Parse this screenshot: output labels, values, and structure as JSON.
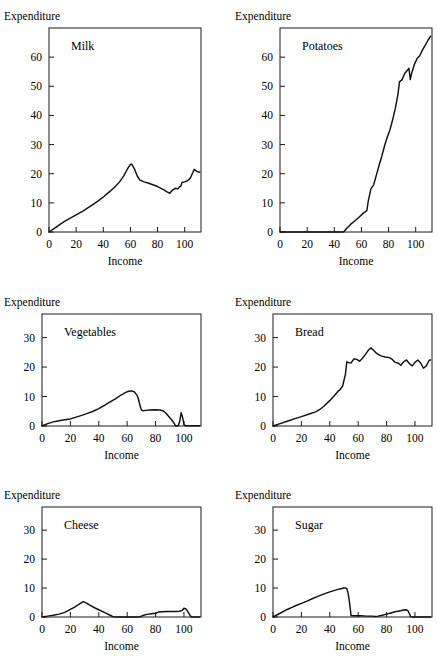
{
  "figure": {
    "ylabel": "Expenditure",
    "xlabel": "Income",
    "line_color": "#111111",
    "axis_color": "#1a1a1a",
    "background": "#ffffff"
  },
  "chart_data": [
    {
      "type": "line",
      "title": "Milk",
      "xlabel": "Income",
      "ylabel": "Expenditure",
      "xlim": [
        0,
        112
      ],
      "ylim": [
        0,
        70
      ],
      "xticks": [
        0,
        20,
        40,
        60,
        80,
        100
      ],
      "yticks": [
        0,
        10,
        20,
        30,
        40,
        50,
        60
      ],
      "grid": false,
      "legend": "none",
      "x": [
        0,
        5,
        10,
        15,
        20,
        25,
        28,
        32,
        36,
        40,
        44,
        48,
        52,
        55,
        58,
        60,
        61,
        63,
        65,
        67,
        70,
        73,
        76,
        80,
        84,
        87,
        89,
        91,
        93,
        95,
        96,
        97,
        98,
        100,
        102,
        104,
        106,
        107,
        109,
        111
      ],
      "y": [
        0,
        1.6,
        3.2,
        4.6,
        5.9,
        7.2,
        8.1,
        9.3,
        10.6,
        12.0,
        13.6,
        15.2,
        17.2,
        19.2,
        21.8,
        23.2,
        23.3,
        21.6,
        19.3,
        17.8,
        17.2,
        16.8,
        16.3,
        15.6,
        14.6,
        13.8,
        13.3,
        14.4,
        15.0,
        14.8,
        15.5,
        15.6,
        17.0,
        17.2,
        17.6,
        18.4,
        20.4,
        21.5,
        20.8,
        20.5
      ]
    },
    {
      "type": "line",
      "title": "Potatoes",
      "xlabel": "Income",
      "ylabel": "Expenditure",
      "xlim": [
        0,
        112
      ],
      "ylim": [
        0,
        70
      ],
      "xticks": [
        0,
        20,
        40,
        60,
        80,
        100
      ],
      "yticks": [
        0,
        10,
        20,
        30,
        40,
        50,
        60
      ],
      "grid": false,
      "legend": "none",
      "x": [
        0,
        10,
        20,
        30,
        40,
        46,
        47,
        49,
        52,
        55,
        58,
        61,
        63,
        64,
        65,
        67,
        69,
        71,
        73,
        75,
        77,
        79,
        81,
        83,
        85,
        87,
        88,
        90,
        92,
        94,
        95,
        96,
        97,
        99,
        101,
        103,
        105,
        107,
        109,
        111
      ],
      "y": [
        0,
        0,
        0,
        0,
        0,
        0,
        0.1,
        1.2,
        2.6,
        3.8,
        5.0,
        6.3,
        7.0,
        7.3,
        10.5,
        14.8,
        16.2,
        19.5,
        22.8,
        26.0,
        29.5,
        32.5,
        35.0,
        38.5,
        42.5,
        47.5,
        51.5,
        52.3,
        54.5,
        55.6,
        56.2,
        52.3,
        54.5,
        57.5,
        59.5,
        60.5,
        62.5,
        64.0,
        65.8,
        67.2
      ]
    },
    {
      "type": "line",
      "title": "Vegetables",
      "xlabel": "Income",
      "ylabel": "Expenditure",
      "xlim": [
        0,
        112
      ],
      "ylim": [
        0,
        38
      ],
      "xticks": [
        0,
        20,
        40,
        60,
        80,
        100
      ],
      "yticks": [
        0,
        10,
        20,
        30
      ],
      "grid": false,
      "legend": "none",
      "x": [
        0,
        4,
        8,
        12,
        16,
        20,
        24,
        28,
        32,
        36,
        40,
        44,
        48,
        52,
        56,
        59,
        61,
        63,
        65,
        67,
        68,
        69,
        70,
        71,
        73,
        76,
        80,
        83,
        85,
        87,
        89,
        91,
        93,
        94,
        96,
        97,
        98,
        99,
        100,
        101,
        103,
        106,
        109,
        111
      ],
      "y": [
        0,
        0.8,
        1.4,
        1.8,
        2.1,
        2.4,
        3.0,
        3.6,
        4.3,
        5.0,
        5.9,
        7.0,
        8.2,
        9.3,
        10.6,
        11.4,
        11.8,
        11.9,
        11.6,
        10.4,
        9.0,
        7.0,
        5.4,
        5.2,
        5.3,
        5.4,
        5.5,
        5.4,
        5.2,
        4.5,
        3.4,
        2.3,
        1.0,
        0.1,
        0.1,
        1.6,
        4.5,
        3.0,
        0.6,
        0.1,
        0.1,
        0.1,
        0.1,
        0.1
      ]
    },
    {
      "type": "line",
      "title": "Bread",
      "xlabel": "Income",
      "ylabel": "Expenditure",
      "xlim": [
        0,
        112
      ],
      "ylim": [
        0,
        38
      ],
      "xticks": [
        0,
        20,
        40,
        60,
        80,
        100
      ],
      "yticks": [
        0,
        10,
        20,
        30
      ],
      "grid": false,
      "legend": "none",
      "x": [
        0,
        5,
        10,
        15,
        20,
        25,
        30,
        33,
        36,
        40,
        43,
        46,
        47,
        49,
        51,
        52,
        53,
        55,
        57,
        59,
        61,
        63,
        65,
        67,
        69,
        71,
        73,
        76,
        79,
        82,
        84,
        86,
        88,
        90,
        92,
        94,
        96,
        98,
        100,
        102,
        104,
        106,
        108,
        110,
        111
      ],
      "y": [
        0,
        0.8,
        1.6,
        2.4,
        3.2,
        4.0,
        4.8,
        5.6,
        6.8,
        8.6,
        10.2,
        11.9,
        12.2,
        13.5,
        17.5,
        21.8,
        21.5,
        21.4,
        22.8,
        22.6,
        22.0,
        23.0,
        24.2,
        25.6,
        26.5,
        25.6,
        24.6,
        23.8,
        23.4,
        23.2,
        22.6,
        21.6,
        21.4,
        20.6,
        21.8,
        22.4,
        21.2,
        20.4,
        21.6,
        22.4,
        21.4,
        19.6,
        20.4,
        22.3,
        22.4
      ]
    },
    {
      "type": "line",
      "title": "Cheese",
      "xlabel": "Income",
      "ylabel": "Expenditure",
      "xlim": [
        0,
        112
      ],
      "ylim": [
        0,
        38
      ],
      "xticks": [
        0,
        20,
        40,
        60,
        80,
        100
      ],
      "yticks": [
        0,
        10,
        20,
        30
      ],
      "grid": false,
      "legend": "none",
      "x": [
        0,
        4,
        8,
        12,
        16,
        20,
        23,
        26,
        29,
        31,
        34,
        37,
        40,
        42,
        44,
        46,
        48,
        50,
        54,
        60,
        66,
        69,
        71,
        74,
        77,
        80,
        82,
        85,
        88,
        91,
        94,
        97,
        99,
        100,
        101,
        102,
        103,
        104,
        105,
        107,
        109,
        111
      ],
      "y": [
        0,
        0.3,
        0.6,
        1.0,
        1.6,
        2.6,
        3.4,
        4.4,
        5.3,
        4.9,
        4.0,
        3.2,
        2.5,
        2.0,
        1.6,
        1.1,
        0.6,
        0.1,
        0,
        0,
        0,
        0.1,
        0.5,
        0.9,
        1.1,
        1.3,
        1.7,
        1.8,
        1.9,
        1.9,
        1.9,
        2.0,
        2.4,
        3.0,
        2.9,
        2.4,
        1.6,
        0.8,
        0.1,
        0,
        0,
        0
      ]
    },
    {
      "type": "line",
      "title": "Sugar",
      "xlabel": "Income",
      "ylabel": "Expenditure",
      "xlim": [
        0,
        112
      ],
      "ylim": [
        0,
        38
      ],
      "xticks": [
        0,
        20,
        40,
        60,
        80,
        100
      ],
      "yticks": [
        0,
        10,
        20,
        30
      ],
      "grid": false,
      "legend": "none",
      "x": [
        0,
        5,
        10,
        15,
        20,
        24,
        28,
        32,
        36,
        40,
        44,
        47,
        50,
        51,
        52,
        53,
        54,
        55,
        56,
        58,
        62,
        66,
        70,
        72,
        74,
        77,
        80,
        83,
        86,
        89,
        92,
        94,
        95,
        96,
        97,
        99,
        102,
        105,
        108,
        111
      ],
      "y": [
        0,
        1.3,
        2.6,
        3.7,
        4.7,
        5.5,
        6.4,
        7.2,
        8.0,
        8.7,
        9.3,
        9.7,
        10.0,
        10.0,
        9.9,
        8.0,
        4.6,
        0.5,
        0.4,
        0.4,
        0.4,
        0.3,
        0.3,
        0.2,
        0.3,
        0.6,
        1.0,
        1.4,
        1.8,
        2.1,
        2.4,
        2.5,
        2.2,
        1.2,
        0.1,
        0,
        0,
        0,
        0,
        0
      ]
    }
  ]
}
